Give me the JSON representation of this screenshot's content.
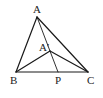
{
  "diagram": {
    "colors": {
      "stroke": "#1a1a1a",
      "label": "#222222",
      "background": "#ffffff"
    },
    "points": {
      "A": {
        "label": "A",
        "x": 37,
        "y": 17
      },
      "B": {
        "label": "B",
        "x": 16,
        "y": 72
      },
      "C": {
        "label": "C",
        "x": 88,
        "y": 72
      },
      "A1": {
        "label": "A′",
        "x": 50,
        "y": 51
      },
      "P": {
        "label": "P",
        "x": 58,
        "y": 72
      }
    },
    "segments": [
      [
        "A",
        "B"
      ],
      [
        "A",
        "C"
      ],
      [
        "B",
        "C"
      ],
      [
        "A",
        "P"
      ],
      [
        "A1",
        "B"
      ],
      [
        "A1",
        "C"
      ]
    ]
  }
}
